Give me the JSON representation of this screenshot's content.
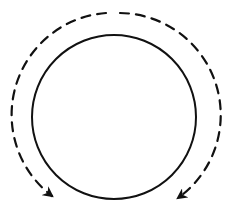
{
  "diagram": {
    "type": "circle-with-dashed-arrows",
    "stroke_color": "#111111",
    "background": "#ffffff",
    "inner_circle": {
      "cx": 114,
      "cy": 117,
      "r": 82,
      "style": "solid",
      "stroke_width": 2
    },
    "outer_arcs": [
      {
        "name": "left-arc",
        "direction": "counterclockwise",
        "style": "dashed",
        "from_angle_deg": -90,
        "to_angle_deg": 125,
        "r": 102,
        "arrowhead": "end"
      },
      {
        "name": "right-arc",
        "direction": "clockwise",
        "style": "dashed",
        "from_angle_deg": -90,
        "to_angle_deg": 55,
        "r": 102,
        "arrowhead": "end"
      }
    ]
  }
}
